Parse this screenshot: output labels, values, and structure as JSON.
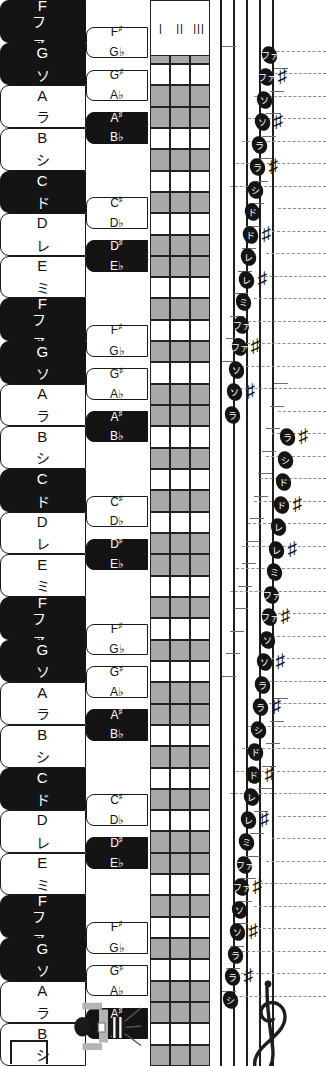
{
  "diagram": {
    "orientation": "rotated-90"
  },
  "colors": {
    "key_white": "#ffffff",
    "key_black": "#141414",
    "grid_shade": "#a8a8a8",
    "ink": "#1d1d1d",
    "dash": "#8d8d8d"
  },
  "keyboard": {
    "white_keys": [
      {
        "latin": "F",
        "kana": "ファ",
        "dark": true
      },
      {
        "latin": "G",
        "kana": "ソ",
        "dark": true
      },
      {
        "latin": "A",
        "kana": "ラ",
        "dark": false
      },
      {
        "latin": "B",
        "kana": "シ",
        "dark": false
      },
      {
        "latin": "C",
        "kana": "ド",
        "dark": true
      },
      {
        "latin": "D",
        "kana": "レ",
        "dark": false
      },
      {
        "latin": "E",
        "kana": "ミ",
        "dark": false
      },
      {
        "latin": "F",
        "kana": "ファ",
        "dark": true
      },
      {
        "latin": "G",
        "kana": "ソ",
        "dark": true
      },
      {
        "latin": "A",
        "kana": "ラ",
        "dark": false
      },
      {
        "latin": "B",
        "kana": "シ",
        "dark": false
      },
      {
        "latin": "C",
        "kana": "ド",
        "dark": true
      },
      {
        "latin": "D",
        "kana": "レ",
        "dark": false
      },
      {
        "latin": "E",
        "kana": "ミ",
        "dark": false
      },
      {
        "latin": "F",
        "kana": "ファ",
        "dark": true
      },
      {
        "latin": "G",
        "kana": "ソ",
        "dark": true
      },
      {
        "latin": "A",
        "kana": "ラ",
        "dark": false
      },
      {
        "latin": "B",
        "kana": "シ",
        "dark": false
      },
      {
        "latin": "C",
        "kana": "ド",
        "dark": true
      },
      {
        "latin": "D",
        "kana": "レ",
        "dark": false
      },
      {
        "latin": "E",
        "kana": "ミ",
        "dark": false
      },
      {
        "latin": "F",
        "kana": "ファ",
        "dark": true
      },
      {
        "latin": "G",
        "kana": "ソ",
        "dark": true
      },
      {
        "latin": "A",
        "kana": "ラ",
        "dark": false
      },
      {
        "latin": "B",
        "kana": "シ",
        "dark": false
      }
    ],
    "black_keys": [
      {
        "sharp": "F#",
        "flat": "G♭",
        "after": 0,
        "filled": false
      },
      {
        "sharp": "G#",
        "flat": "A♭",
        "after": 1,
        "filled": false
      },
      {
        "sharp": "A#",
        "flat": "B♭",
        "after": 2,
        "filled": true
      },
      {
        "sharp": "C#",
        "flat": "D♭",
        "after": 4,
        "filled": false
      },
      {
        "sharp": "D#",
        "flat": "E♭",
        "after": 5,
        "filled": true
      },
      {
        "sharp": "F#",
        "flat": "G♭",
        "after": 7,
        "filled": false
      },
      {
        "sharp": "G#",
        "flat": "A♭",
        "after": 8,
        "filled": false
      },
      {
        "sharp": "A#",
        "flat": "B♭",
        "after": 9,
        "filled": true
      },
      {
        "sharp": "C#",
        "flat": "D♭",
        "after": 11,
        "filled": false
      },
      {
        "sharp": "D#",
        "flat": "E♭",
        "after": 12,
        "filled": true
      },
      {
        "sharp": "F#",
        "flat": "G♭",
        "after": 14,
        "filled": false
      },
      {
        "sharp": "G#",
        "flat": "A♭",
        "after": 15,
        "filled": false
      },
      {
        "sharp": "A#",
        "flat": "B♭",
        "after": 16,
        "filled": true
      },
      {
        "sharp": "C#",
        "flat": "D♭",
        "after": 18,
        "filled": false
      },
      {
        "sharp": "D#",
        "flat": "E♭",
        "after": 19,
        "filled": true
      },
      {
        "sharp": "F#",
        "flat": "G♭",
        "after": 21,
        "filled": false
      },
      {
        "sharp": "G#",
        "flat": "A♭",
        "after": 22,
        "filled": false
      },
      {
        "sharp": "A#",
        "flat": "B♭",
        "after": 23,
        "filled": true
      }
    ]
  },
  "grid": {
    "columns": 3,
    "shaded_rows": [
      0,
      2,
      4,
      5,
      7,
      9,
      11,
      12,
      14,
      16,
      18,
      19,
      21,
      23,
      25,
      26,
      28,
      30,
      32,
      33,
      35,
      37,
      39,
      40,
      42,
      44,
      46,
      47,
      49
    ]
  },
  "string_marks": [
    "|||",
    "||",
    "|"
  ],
  "staff": {
    "lines": 5,
    "clef": "treble-clef",
    "notes": [
      {
        "kana": "シ",
        "sharp": false
      },
      {
        "kana": "ラ",
        "sharp": true
      },
      {
        "kana": "ラ",
        "sharp": false
      },
      {
        "kana": "ソ",
        "sharp": true
      },
      {
        "kana": "ソ",
        "sharp": false
      },
      {
        "kana": "ファ",
        "sharp": true
      },
      {
        "kana": "ファ",
        "sharp": false
      },
      {
        "kana": "ミ",
        "sharp": false
      },
      {
        "kana": "レ",
        "sharp": true
      },
      {
        "kana": "レ",
        "sharp": false
      },
      {
        "kana": "ド",
        "sharp": true
      },
      {
        "kana": "ド",
        "sharp": false
      },
      {
        "kana": "シ",
        "sharp": false
      },
      {
        "kana": "ラ",
        "sharp": true
      },
      {
        "kana": "ラ",
        "sharp": false
      },
      {
        "kana": "ソ",
        "sharp": true
      },
      {
        "kana": "ソ",
        "sharp": false
      },
      {
        "kana": "ファ",
        "sharp": true
      },
      {
        "kana": "ファ",
        "sharp": false
      },
      {
        "kana": "ミ",
        "sharp": false
      },
      {
        "kana": "レ",
        "sharp": true
      },
      {
        "kana": "レ",
        "sharp": false
      },
      {
        "kana": "ド",
        "sharp": true
      },
      {
        "kana": "ド",
        "sharp": false
      },
      {
        "kana": "シ",
        "sharp": false
      },
      {
        "kana": "ラ",
        "sharp": true
      },
      {
        "kana": "ラ",
        "sharp": false
      },
      {
        "kana": "ソ",
        "sharp": true
      },
      {
        "kana": "ソ",
        "sharp": false
      },
      {
        "kana": "ファ",
        "sharp": true
      },
      {
        "kana": "ファ",
        "sharp": false
      },
      {
        "kana": "ミ",
        "sharp": false
      },
      {
        "kana": "レ",
        "sharp": true
      },
      {
        "kana": "レ",
        "sharp": false
      },
      {
        "kana": "ド",
        "sharp": true
      },
      {
        "kana": "ド",
        "sharp": false
      },
      {
        "kana": "シ",
        "sharp": false
      },
      {
        "kana": "ラ",
        "sharp": true
      },
      {
        "kana": "ラ",
        "sharp": false
      },
      {
        "kana": "ソ",
        "sharp": true
      },
      {
        "kana": "ソ",
        "sharp": false
      },
      {
        "kana": "ファ",
        "sharp": true
      },
      {
        "kana": "ファ",
        "sharp": false
      }
    ]
  },
  "tuner": {
    "label": "machine-head-illustration"
  }
}
